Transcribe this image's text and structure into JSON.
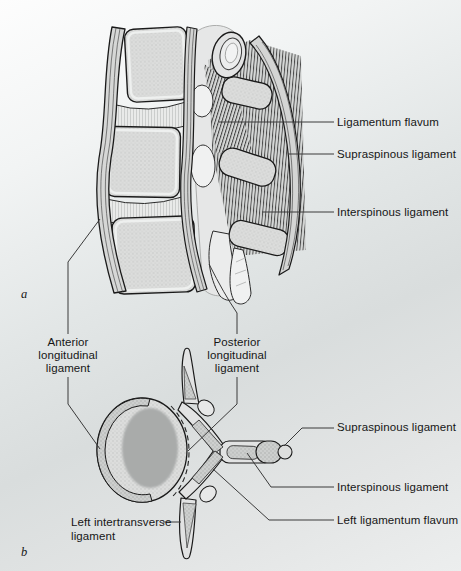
{
  "figure_type": "anatomical diagram of vertebral ligaments, lateral (a) and superior/axial (b) views",
  "palette": {
    "outline": "#1a1a1a",
    "leader_line": "#3a3a3a",
    "bone_fill": "#dcdddc",
    "bone_stipple": "#bfc1c0",
    "ligament_dense_fill": "#cdcfce",
    "ligament_dense_stipple": "#a7a9a8",
    "band_fill": "#d6d7d6",
    "disc_fill": "#e9eae9",
    "body_core": "#a9abaa",
    "background_top": "#fdfdfd",
    "background_mid": "#d9dddd",
    "text": "#161616"
  },
  "panel_a": {
    "letter": "a",
    "labels": {
      "ligamentum_flavum": "Ligamentum flavum",
      "supraspinous_ligament": "Supraspinous ligament",
      "interspinous_ligament": "Interspinous ligament"
    }
  },
  "midsection": {
    "anterior_longitudinal_ligament": "Anterior\nlongitudinal\nligament",
    "posterior_longitudinal_ligament": "Posterior\nlongitudinal\nligament"
  },
  "panel_b": {
    "letter": "b",
    "labels": {
      "supraspinous_ligament": "Supraspinous ligament",
      "interspinous_ligament": "Interspinous ligament",
      "left_ligamentum_flavum": "Left ligamentum flavum",
      "left_intertransverse_ligament": "Left intertransverse\nligament"
    }
  }
}
